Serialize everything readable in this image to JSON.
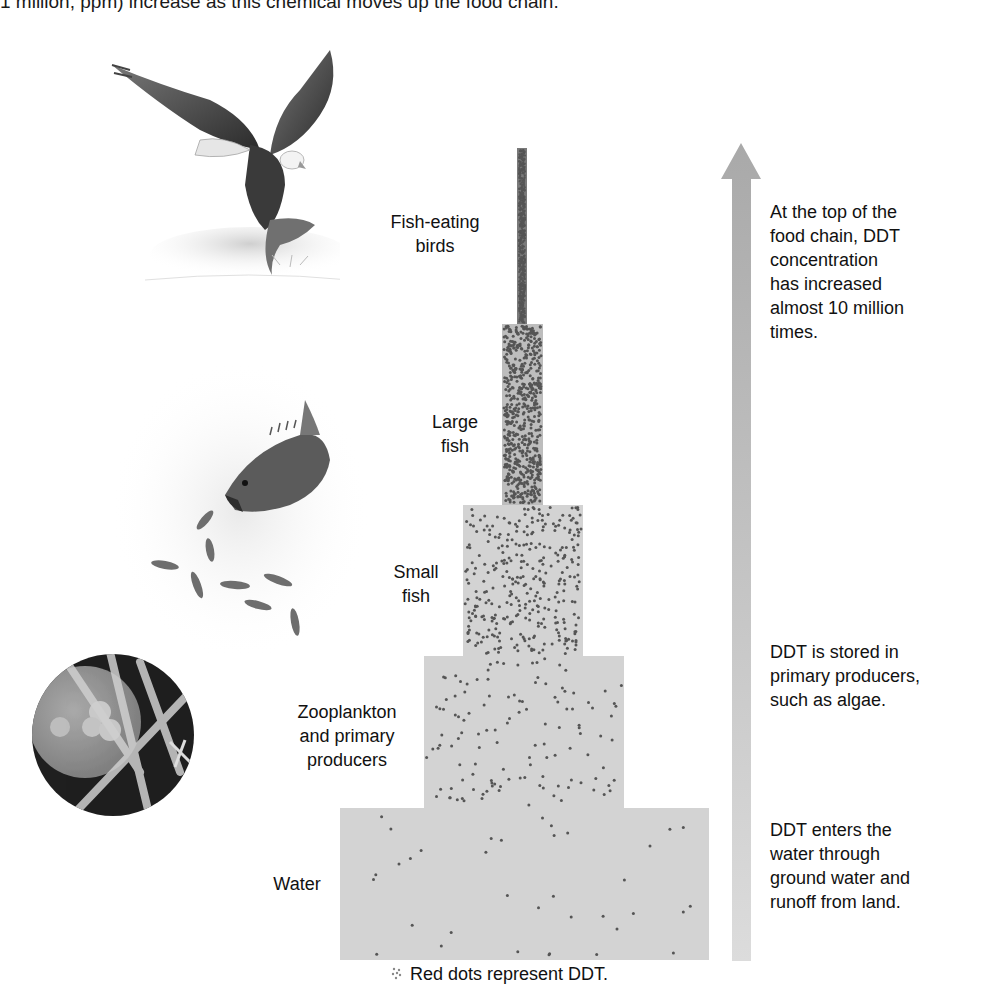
{
  "intro_text_fragment": "1 million, ppm) increase as this chemical moves up the food chain.",
  "pyramid": {
    "tiers": [
      {
        "id": "fish-eating-birds",
        "label_lines": [
          "Fish-eating",
          "birds"
        ],
        "dot_density": "very high"
      },
      {
        "id": "large-fish",
        "label_lines": [
          "Large",
          "fish"
        ],
        "dot_density": "high"
      },
      {
        "id": "small-fish",
        "label_lines": [
          "Small",
          "fish"
        ],
        "dot_density": "medium"
      },
      {
        "id": "zooplankton",
        "label_lines": [
          "Zooplankton",
          "and primary",
          "producers"
        ],
        "dot_density": "low"
      },
      {
        "id": "water",
        "label_lines": [
          "Water"
        ],
        "dot_density": "very low"
      }
    ],
    "tier_color": "#d3d3d3",
    "dot_color": "#555555"
  },
  "arrow": {
    "direction": "up",
    "color": "#b5b5b5"
  },
  "notes": {
    "top": [
      "At the top of the",
      "food chain, DDT",
      "concentration",
      "has increased",
      "almost 10 million",
      "times."
    ],
    "middle": [
      "DDT is stored in",
      "primary producers,",
      "such as algae."
    ],
    "bottom": [
      "DDT enters the",
      "water through",
      "ground water and",
      "runoff from land."
    ]
  },
  "legend": {
    "text": "Red dots represent DDT."
  },
  "illustrations": {
    "top": "eagle catching fish",
    "middle": "large fish eating small fish",
    "bottom": "microscopic algae and zooplankton"
  }
}
